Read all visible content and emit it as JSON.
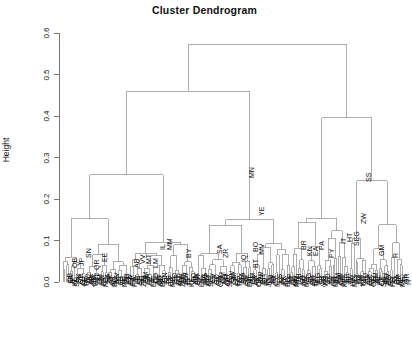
{
  "chart_data": {
    "type": "dendrogram",
    "title": "Cluster Dendrogram",
    "xlabel": "",
    "ylabel": "Height",
    "ylim": [
      0.0,
      0.6
    ],
    "ytick_labels": [
      "0.0",
      "0.1",
      "0.2",
      "0.3",
      "0.4",
      "0.5",
      "0.6"
    ],
    "ytick_values": [
      0.0,
      0.1,
      0.2,
      0.3,
      0.4,
      0.5,
      0.6
    ],
    "grid": false,
    "legend": "none",
    "line_color": "#8c8c8c",
    "axis_color": "#555555",
    "root_height": 0.572,
    "n_leaves": 178,
    "leaf_label_rotation": 90,
    "labels": [
      "QB",
      "ZA",
      "JP",
      "KL",
      "SN",
      "SK",
      "QR",
      "QJ",
      "EE",
      "TR",
      "VC",
      "MK",
      "AB",
      "GM",
      "VV",
      "MT",
      "LM",
      "HN",
      "BY",
      "ND",
      "SA",
      "ZR",
      "QT",
      "IQ",
      "BO",
      "MV",
      "BT",
      "LS",
      "YE",
      "MN",
      "BR",
      "KN",
      "EA",
      "PA",
      "PY",
      "IT",
      "HT",
      "SE",
      "SQ",
      "ZW",
      "GM",
      "GR",
      "DZ",
      "CF",
      "LR",
      "CD",
      "NE",
      "TD",
      "ML",
      "BF",
      "GN",
      "SL",
      "TG",
      "BJ",
      "MR",
      "SO",
      "ET",
      "MZ",
      "MW",
      "ZM",
      "UG",
      "RW",
      "BI",
      "TZ",
      "KE",
      "AO",
      "NA",
      "BW",
      "SZ",
      "LS",
      "ZA",
      "MG",
      "KM",
      "MU",
      "SC",
      "CV",
      "ST",
      "GQ",
      "GA",
      "CG",
      "CM",
      "NG",
      "GH",
      "CI",
      "SN",
      "GW",
      "GM",
      "LY",
      "EG",
      "TN",
      "MA",
      "SD",
      "SS",
      "ER",
      "DJ",
      "YE",
      "OM",
      "SA",
      "AE",
      "QA",
      "KW",
      "BH",
      "IQ",
      "IR",
      "JO",
      "LB",
      "SY",
      "TR",
      "CY",
      "IL",
      "PS",
      "AF",
      "PK",
      "IN",
      "BD",
      "NP",
      "BT",
      "LK",
      "MV",
      "MM",
      "TH",
      "LA",
      "KH",
      "VN",
      "MY",
      "SG",
      "ID",
      "PH",
      "BN",
      "TL",
      "PG",
      "FJ",
      "SB",
      "VU",
      "WS",
      "TO",
      "KI",
      "TV",
      "NR",
      "MH",
      "FM",
      "PW",
      "CN",
      "MN",
      "KP",
      "KR",
      "JP",
      "TW",
      "HK",
      "MO",
      "KZ",
      "UZ",
      "TM",
      "KG",
      "TJ",
      "RU",
      "UA",
      "BY",
      "MD",
      "GE",
      "AM",
      "AZ",
      "PL",
      "CZ",
      "SK",
      "HU",
      "RO",
      "BG",
      "RS",
      "HR",
      "SI",
      "BA",
      "MK",
      "AL",
      "ME",
      "XK",
      "GR",
      "IT",
      "ES",
      "PT"
    ],
    "visible_labels_top": [
      {
        "text": "QB",
        "x": 71,
        "y": 268
      },
      {
        "text": "JP",
        "x": 78,
        "y": 266
      },
      {
        "text": "SN",
        "x": 85,
        "y": 258
      },
      {
        "text": "QR",
        "x": 93,
        "y": 270
      },
      {
        "text": "EE",
        "x": 101,
        "y": 262
      },
      {
        "text": "AB",
        "x": 133,
        "y": 268
      },
      {
        "text": "VV",
        "x": 139,
        "y": 264
      },
      {
        "text": "MT",
        "x": 145,
        "y": 264
      },
      {
        "text": "LM",
        "x": 152,
        "y": 268
      },
      {
        "text": "IL",
        "x": 159,
        "y": 250
      },
      {
        "text": "MM",
        "x": 166,
        "y": 250
      },
      {
        "text": "BY",
        "x": 185,
        "y": 258
      },
      {
        "text": "SA",
        "x": 216,
        "y": 254
      },
      {
        "text": "ZR",
        "x": 222,
        "y": 258
      },
      {
        "text": "IQ",
        "x": 240,
        "y": 262
      },
      {
        "text": "BO",
        "x": 252,
        "y": 252
      },
      {
        "text": "MV",
        "x": 258,
        "y": 254
      },
      {
        "text": "BT",
        "x": 252,
        "y": 268
      },
      {
        "text": "YE",
        "x": 258,
        "y": 216
      },
      {
        "text": "MN",
        "x": 248,
        "y": 178
      },
      {
        "text": "BR",
        "x": 300,
        "y": 250
      },
      {
        "text": "KN",
        "x": 306,
        "y": 256
      },
      {
        "text": "EA",
        "x": 312,
        "y": 256
      },
      {
        "text": "PA",
        "x": 318,
        "y": 250
      },
      {
        "text": "PY",
        "x": 328,
        "y": 258
      },
      {
        "text": "IT",
        "x": 340,
        "y": 244
      },
      {
        "text": "HT",
        "x": 346,
        "y": 242
      },
      {
        "text": "SEG",
        "x": 353,
        "y": 246
      },
      {
        "text": "ZW",
        "x": 360,
        "y": 224
      },
      {
        "text": "SS",
        "x": 365,
        "y": 182
      },
      {
        "text": "GM",
        "x": 378,
        "y": 256
      },
      {
        "text": "R",
        "x": 392,
        "y": 258
      }
    ]
  }
}
